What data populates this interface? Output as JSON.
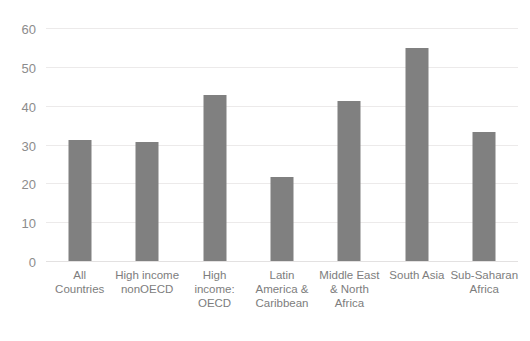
{
  "chart_data": {
    "type": "bar",
    "title": "",
    "subtitle": "",
    "xlabel": "",
    "ylabel": "",
    "ylim": [
      0,
      60
    ],
    "ytick_step": 10,
    "yticks": [
      0,
      10,
      20,
      30,
      40,
      50,
      60
    ],
    "grid": true,
    "legend": false,
    "legend_position": "none",
    "bar_color": "#808080",
    "gridline_color": "#eceaea",
    "tick_label_color": "#8c8c8c",
    "category_label_color": "#7d7d7d",
    "background_color": "#ffffff",
    "categories": [
      "All\nCountries",
      "High income\nnonOECD",
      "High\nincome:\nOECD",
      "Latin\nAmerica &\nCaribbean",
      "Middle East\n& North\nAfrica",
      "South Asia",
      "Sub-Saharan\nAfrica"
    ],
    "values": [
      31.5,
      31,
      43,
      22,
      41.5,
      55,
      33.5
    ]
  }
}
